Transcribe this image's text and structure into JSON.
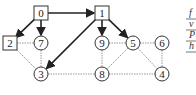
{
  "diagram": {
    "type": "directed-graph-traversal",
    "nodes": [
      {
        "id": "0",
        "label": "0",
        "shape": "square",
        "x": 41,
        "y": 13
      },
      {
        "id": "1",
        "label": "1",
        "shape": "square",
        "x": 102,
        "y": 13
      },
      {
        "id": "2",
        "label": "2",
        "shape": "square",
        "x": 10,
        "y": 43
      },
      {
        "id": "7",
        "label": "7",
        "shape": "circle",
        "x": 41,
        "y": 43
      },
      {
        "id": "3",
        "label": "3",
        "shape": "circle",
        "x": 41,
        "y": 74
      },
      {
        "id": "9",
        "label": "9",
        "shape": "circle",
        "x": 102,
        "y": 43
      },
      {
        "id": "5",
        "label": "5",
        "shape": "circle",
        "x": 133,
        "y": 43
      },
      {
        "id": "6",
        "label": "6",
        "shape": "circle",
        "x": 162,
        "y": 43
      },
      {
        "id": "8",
        "label": "8",
        "shape": "circle",
        "x": 102,
        "y": 74
      },
      {
        "id": "4",
        "label": "4",
        "shape": "circle",
        "x": 162,
        "y": 74
      }
    ],
    "tree_edges": [
      [
        "0",
        "1"
      ],
      [
        "0",
        "2"
      ],
      [
        "0",
        "7"
      ],
      [
        "1",
        "9"
      ],
      [
        "1",
        "5"
      ],
      [
        "1",
        "3"
      ]
    ],
    "other_edges": [
      [
        "2",
        "7"
      ],
      [
        "2",
        "3"
      ],
      [
        "7",
        "3"
      ],
      [
        "3",
        "8"
      ],
      [
        "9",
        "5"
      ],
      [
        "9",
        "8"
      ],
      [
        "5",
        "6"
      ],
      [
        "5",
        "8"
      ],
      [
        "5",
        "4"
      ],
      [
        "6",
        "4"
      ],
      [
        "8",
        "4"
      ]
    ],
    "side_labels": [
      "f",
      "v",
      "P",
      "h"
    ],
    "colors": {
      "tree_edge": "#222222",
      "other_edge": "#9a9a9a",
      "node_stroke": "#333333"
    }
  }
}
